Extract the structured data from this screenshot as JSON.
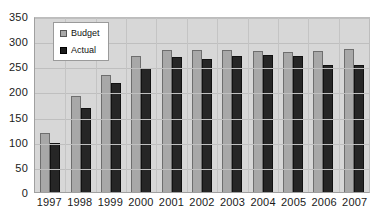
{
  "chart_data": {
    "type": "bar",
    "title": "",
    "xlabel": "",
    "ylabel": "",
    "ylim": [
      0,
      350
    ],
    "ytick_step": 50,
    "yticks": [
      350,
      300,
      250,
      200,
      150,
      100,
      50,
      0
    ],
    "grid": true,
    "legend_position": "top-left-inside",
    "categories": [
      "1997",
      "1998",
      "1999",
      "2000",
      "2001",
      "2002",
      "2003",
      "2004",
      "2005",
      "2006",
      "2007"
    ],
    "series": [
      {
        "name": "Budget",
        "color": "#a8a8a8",
        "values": [
          118,
          190,
          232,
          270,
          282,
          282,
          282,
          280,
          278,
          280,
          285
        ]
      },
      {
        "name": "Actual",
        "color": "#262626",
        "values": [
          97,
          168,
          216,
          247,
          268,
          265,
          270,
          272,
          270,
          252,
          253
        ]
      }
    ]
  },
  "legend": {
    "items": [
      {
        "label": "Budget",
        "swatch": "budget-swatch-icon"
      },
      {
        "label": "Actual",
        "swatch": "actual-swatch-icon"
      }
    ]
  }
}
